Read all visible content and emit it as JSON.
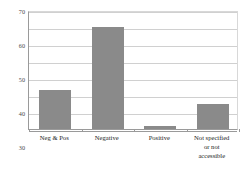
{
  "chart_data": {
    "type": "bar",
    "title": "",
    "subtitle": "",
    "xlabel": "",
    "ylabel": "",
    "categories": [
      "Neg & Pos",
      "Negative",
      "Positive",
      "Not specified or not accessible"
    ],
    "category_lines": [
      [
        "Neg & Pos"
      ],
      [
        "Negative"
      ],
      [
        "Positive"
      ],
      [
        "Not specified",
        "or not",
        "accessible"
      ]
    ],
    "values": [
      23,
      60,
      2,
      14.5
    ],
    "ylim": [
      0,
      70
    ],
    "yticks": [
      0,
      10,
      20,
      30,
      40,
      50,
      60,
      70
    ],
    "ytick_labels": [
      "0",
      "10",
      "20",
      "30",
      "40",
      "50",
      "60",
      "70"
    ],
    "grid": true,
    "grid_axis": "y",
    "legend": false,
    "legend_position": "none",
    "bar_color": "#8a8a8a",
    "gridline_color": "#d0d0d0",
    "axis_color": "#9a9a9a",
    "background_color": "#ffffff"
  }
}
